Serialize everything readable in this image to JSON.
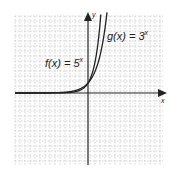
{
  "chart_data": {
    "type": "line",
    "title": "",
    "xlabel": "x",
    "ylabel": "y",
    "grid": true,
    "xlim": [
      -7,
      7
    ],
    "ylim": [
      -7,
      7
    ],
    "series": [
      {
        "name": "f(x) = 5^x",
        "label_text": "f(x) = 5",
        "exponent": "x",
        "base": 5,
        "x": [
          -7,
          -3,
          -2,
          -1,
          0,
          0.5,
          1,
          1.2
        ],
        "y": [
          1.28e-05,
          0.008,
          0.04,
          0.2,
          1,
          2.24,
          5,
          6.9
        ]
      },
      {
        "name": "g(x) = 3^x",
        "label_text": "g(x) = 3",
        "exponent": "x",
        "base": 3,
        "x": [
          -7,
          -3,
          -2,
          -1,
          0,
          0.5,
          1,
          1.5,
          1.75
        ],
        "y": [
          0.00046,
          0.037,
          0.111,
          0.333,
          1,
          1.73,
          3,
          5.2,
          6.8
        ]
      }
    ],
    "annotations": [
      {
        "text": "f(x) = 5^x",
        "position": "left of y-axis, upper"
      },
      {
        "text": "g(x) = 3^x",
        "position": "right of y-axis, top"
      }
    ]
  },
  "axes": {
    "x_label": "x",
    "y_label": "y"
  },
  "labels": {
    "f_text": "f(x) = 5",
    "f_exp": "x",
    "g_text": "g(x) = 3",
    "g_exp": "x"
  }
}
